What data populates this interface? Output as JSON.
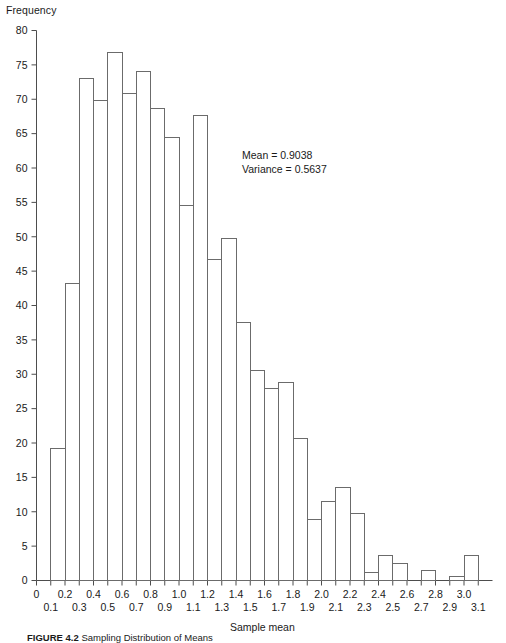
{
  "figure": {
    "ylabel": "Frequency",
    "xlabel": "Sample mean",
    "caption_label": "FIGURE 4.2",
    "caption_text": "Sampling Distribution of Means"
  },
  "annotation": {
    "mean_line": "Mean = 0.9038",
    "variance_line": "Variance = 0.5637"
  },
  "chart_data": {
    "type": "bar",
    "title": "",
    "xlabel": "Sample mean",
    "ylabel": "Frequency",
    "xlim": [
      0,
      3.2
    ],
    "ylim": [
      0,
      80
    ],
    "grid": false,
    "legend": null,
    "bin_width": 0.1,
    "yticks": [
      0,
      5,
      10,
      15,
      20,
      25,
      30,
      35,
      40,
      45,
      50,
      55,
      60,
      65,
      70,
      75,
      80
    ],
    "xticks": [
      0,
      0.1,
      0.2,
      0.3,
      0.4,
      0.5,
      0.6,
      0.7,
      0.8,
      0.9,
      1.0,
      1.1,
      1.2,
      1.3,
      1.4,
      1.5,
      1.6,
      1.7,
      1.8,
      1.9,
      2.0,
      2.1,
      2.2,
      2.3,
      2.4,
      2.5,
      2.6,
      2.7,
      2.8,
      2.9,
      3.0,
      3.1
    ],
    "xticklabels": [
      "0",
      "0.1",
      "0.2",
      "0.3",
      "0.4",
      "0.5",
      "0.6",
      "0.7",
      "0.8",
      "0.9",
      "1.0",
      "1.1",
      "1.2",
      "1.3",
      "1.4",
      "1.5",
      "1.6",
      "1.7",
      "1.8",
      "1.9",
      "2.0",
      "2.1",
      "2.2",
      "2.3",
      "2.4",
      "2.5",
      "2.6",
      "2.7",
      "2.8",
      "2.9",
      "3.0",
      "3.1"
    ],
    "bin_starts": [
      0.1,
      0.2,
      0.3,
      0.4,
      0.5,
      0.6,
      0.7,
      0.8,
      0.9,
      1.0,
      1.1,
      1.2,
      1.3,
      1.4,
      1.5,
      1.6,
      1.7,
      1.8,
      1.9,
      2.0,
      2.1,
      2.2,
      2.3,
      2.4,
      2.5,
      2.6,
      2.7,
      2.8,
      2.9,
      3.0
    ],
    "values": [
      19.2,
      43.2,
      73.0,
      69.8,
      76.8,
      70.9,
      74.0,
      68.6,
      64.4,
      54.5,
      67.6,
      46.7,
      49.7,
      37.6,
      30.5,
      28.0,
      28.8,
      20.6,
      8.9,
      11.5,
      13.6,
      9.8,
      1.2,
      3.6,
      2.5,
      0.0,
      1.4,
      0.0,
      0.6,
      3.6
    ],
    "mean": 0.9038,
    "variance": 0.5637
  }
}
